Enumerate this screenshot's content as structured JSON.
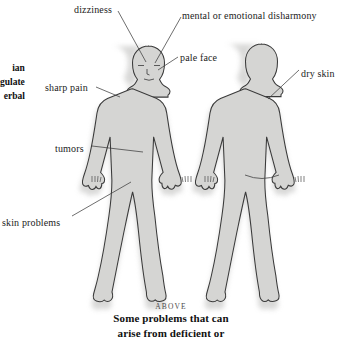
{
  "illustration": {
    "alt_name": "two-human-body-figures-front-and-back",
    "body_fill": "#d5d5d3",
    "body_outline": "#3a3a3a",
    "shadow": "#c9c9c7",
    "leader_line_color": "#3d3d3d"
  },
  "labels": [
    {
      "id": "dizziness",
      "text": "dizziness",
      "x": 74,
      "y": 4
    },
    {
      "id": "mental-or-emotional-disharmony",
      "text": "mental or emotional disharmony",
      "x": 182,
      "y": 10
    },
    {
      "id": "pale-face",
      "text": "pale face",
      "x": 180,
      "y": 52
    },
    {
      "id": "dry-skin",
      "text": "dry skin",
      "x": 301,
      "y": 68
    },
    {
      "id": "sharp-pain",
      "text": "sharp pain",
      "x": 45,
      "y": 82
    },
    {
      "id": "tumors",
      "text": "tumors",
      "x": 55,
      "y": 143
    },
    {
      "id": "skin-problems",
      "text": "skin problems",
      "x": 2,
      "y": 217
    }
  ],
  "margin_note": {
    "lines": [
      "ian",
      "gulate",
      "erbal"
    ],
    "x": 0,
    "y": 61
  },
  "caption": {
    "kicker": "ABOVE",
    "lines": [
      "Some problems that can",
      "arise from deficient or"
    ]
  }
}
